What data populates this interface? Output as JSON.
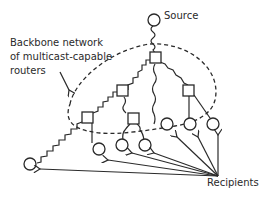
{
  "diagram": {
    "labels": {
      "source": "Source",
      "backbone_line1": "Backbone network",
      "backbone_line2": "of multicast-capable",
      "backbone_line3": "routers",
      "recipients": "Recipients"
    },
    "nodes": {
      "source": {
        "type": "host",
        "shape": "circle"
      },
      "routers": [
        {
          "id": "r-top",
          "shape": "square"
        },
        {
          "id": "r-left-mid",
          "shape": "square"
        },
        {
          "id": "r-right",
          "shape": "square"
        },
        {
          "id": "r-far-left",
          "shape": "square"
        },
        {
          "id": "r-center",
          "shape": "square"
        }
      ],
      "recipients": [
        {
          "id": "h1",
          "shape": "circle"
        },
        {
          "id": "h2",
          "shape": "circle"
        },
        {
          "id": "h3",
          "shape": "circle"
        },
        {
          "id": "h4",
          "shape": "circle"
        },
        {
          "id": "h5",
          "shape": "circle"
        },
        {
          "id": "h6",
          "shape": "circle"
        },
        {
          "id": "h7",
          "shape": "circle"
        }
      ]
    },
    "colors": {
      "stroke": "#2a2a2a",
      "background": "#ffffff"
    }
  }
}
